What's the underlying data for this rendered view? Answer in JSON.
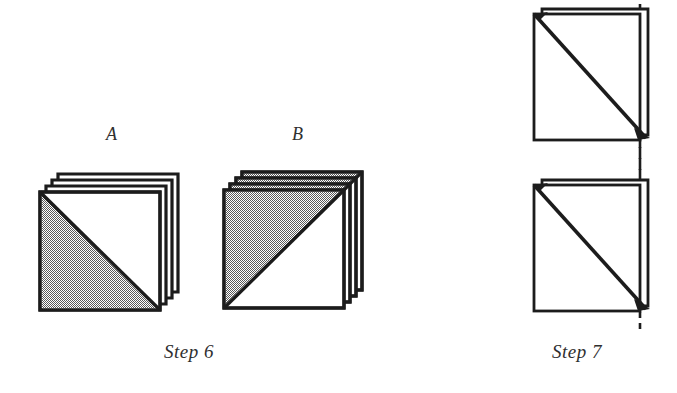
{
  "figure": {
    "background_color": "#ffffff",
    "ink_color": "#1c1c1c",
    "shade_color": "#8c8c8c",
    "panels": [
      {
        "id": "step6",
        "caption": "Step 6",
        "caption_position": {
          "x": 164,
          "y": 341
        },
        "stacks": [
          {
            "id": "stack-a",
            "label": "A",
            "label_position": {
              "x": 106,
              "y": 124
            },
            "sheet_count": 4,
            "front_sheet": {
              "x": 40,
              "y": 192,
              "width": 120,
              "height": 118
            },
            "offset_per_sheet": {
              "dx": 6,
              "dy": -6
            },
            "shaded_half": "lower-left",
            "diagonal": "top-left-to-bottom-right",
            "back_sheet_face": "white"
          },
          {
            "id": "stack-b",
            "label": "B",
            "label_position": {
              "x": 292,
              "y": 124
            },
            "sheet_count": 4,
            "front_sheet": {
              "x": 224,
              "y": 190,
              "width": 120,
              "height": 118
            },
            "offset_per_sheet": {
              "dx": 6,
              "dy": -6
            },
            "shaded_half": "upper-left",
            "diagonal": "bottom-left-to-top-right",
            "back_sheet_face": "shaded"
          }
        ]
      },
      {
        "id": "step7",
        "caption": "Step 7",
        "caption_position": {
          "x": 552,
          "y": 341
        },
        "stacks": [
          {
            "id": "stack-top",
            "label": "",
            "sheet_count": 2,
            "front_sheet": {
              "x": 534,
              "y": 14,
              "width": 106,
              "height": 126
            },
            "offset_per_sheet": {
              "dx": 8,
              "dy": -5
            },
            "shaded_half": "none",
            "diagonal": "top-left-to-bottom-right",
            "back_sheet_face": "white"
          },
          {
            "id": "stack-bottom",
            "label": "",
            "sheet_count": 2,
            "front_sheet": {
              "x": 534,
              "y": 185,
              "width": 106,
              "height": 126
            },
            "offset_per_sheet": {
              "dx": 8,
              "dy": -5
            },
            "shaded_half": "none",
            "diagonal": "top-left-to-bottom-right",
            "back_sheet_face": "white"
          }
        ],
        "alignment_guide": {
          "type": "dashed-vertical-line",
          "x": 640,
          "y_start": 4,
          "y_end": 330,
          "dash": "6 5",
          "color": "#1c1c1c"
        }
      }
    ]
  }
}
